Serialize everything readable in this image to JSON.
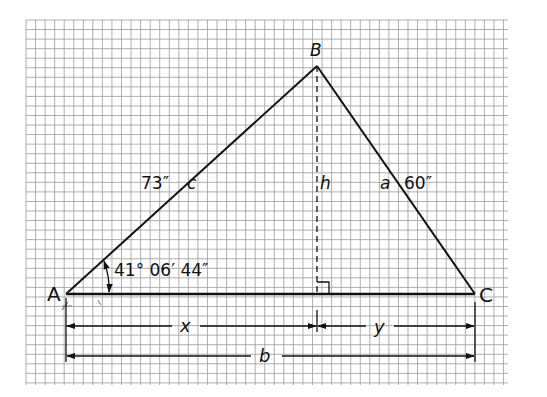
{
  "diagram": {
    "title": "",
    "type": "oblique triangle with altitude on graph paper",
    "vertices": [
      {
        "id": "A",
        "label": "A",
        "x": 66,
        "y": 294
      },
      {
        "id": "B",
        "label": "B",
        "x": 317,
        "y": 66
      },
      {
        "id": "C",
        "label": "C",
        "x": 475,
        "y": 294
      }
    ],
    "sides": {
      "c": {
        "label": "c",
        "length_label": "73″",
        "from": "A",
        "to": "B"
      },
      "a": {
        "label": "a",
        "length_label": "60″",
        "from": "B",
        "to": "C"
      },
      "b": {
        "label": "b",
        "from": "A",
        "to": "C"
      }
    },
    "altitude": {
      "label": "h",
      "from": "B",
      "style": "dashed",
      "right_angle_marker": true
    },
    "angle_A": {
      "label": "41° 06′ 44″"
    },
    "dimensions": {
      "x_label": "x",
      "y_label": "y",
      "b_label": "b"
    },
    "colors": {
      "line": "#111111",
      "grid_minor": "#9a9a9a",
      "grid_major": "#6f6f6f",
      "background": "#ffffff"
    }
  }
}
